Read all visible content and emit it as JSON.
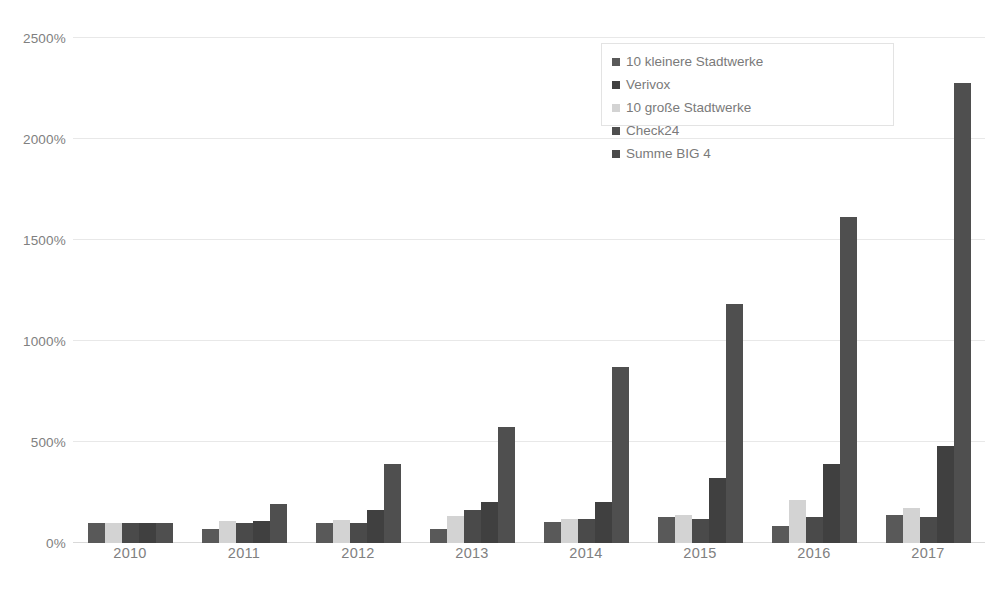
{
  "chart_data": {
    "type": "bar",
    "title": "",
    "subtitle": "",
    "xlabel": "",
    "ylabel": "",
    "categories": [
      "2010",
      "2011",
      "2012",
      "2013",
      "2014",
      "2015",
      "2016",
      "2017"
    ],
    "ytick_labels": [
      "0%",
      "500%",
      "1000%",
      "1500%",
      "2000%",
      "2500%"
    ],
    "ytick_values": [
      0,
      500,
      1000,
      1500,
      2000,
      2500
    ],
    "ylim": [
      0,
      2500
    ],
    "grid": "horizontal",
    "legend_position": "top-right",
    "value_suffix": "%",
    "series": [
      {
        "name": "10  kleinere Stadtwerke",
        "color": "#595959",
        "values": [
          100,
          70,
          100,
          70,
          105,
          130,
          85,
          140
        ]
      },
      {
        "name": "10 große Stadtwerke",
        "color": "#d3d3d3",
        "values": [
          100,
          110,
          115,
          135,
          120,
          140,
          215,
          175
        ]
      },
      {
        "name": "Summe BIG 4",
        "color": "#4a4a4a",
        "values": [
          100,
          100,
          100,
          165,
          120,
          120,
          130,
          130
        ]
      },
      {
        "name": "Verivox",
        "color": "#404040",
        "values": [
          100,
          110,
          165,
          205,
          205,
          320,
          390,
          480
        ]
      },
      {
        "name": "Check24",
        "color": "#4f4f4f",
        "values": [
          100,
          195,
          390,
          575,
          870,
          1185,
          1615,
          2275
        ]
      }
    ]
  },
  "legend": {
    "left_column": [
      "10  kleinere Stadtwerke",
      "10 große Stadtwerke",
      "Summe BIG 4"
    ],
    "right_column": [
      "Verivox",
      "Check24"
    ]
  },
  "colors": {
    "background": "#ffffff",
    "gridline": "#e8e8e8",
    "baseline": "#d9d9d9",
    "axis_text": "#808080",
    "legend_text": "#7a7a7a",
    "legend_border": "#e3e3e3"
  }
}
